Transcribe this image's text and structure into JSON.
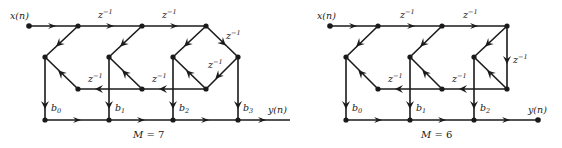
{
  "diagrams": [
    {
      "caption": {
        "var": "M",
        "eq": " = 7"
      },
      "input_label": "x(n)",
      "output_label": "y(n)",
      "delay_label": "z",
      "delay_exp": "−1",
      "coefficients": [
        {
          "base": "b",
          "sub": "0"
        },
        {
          "base": "b",
          "sub": "1"
        },
        {
          "base": "b",
          "sub": "2"
        },
        {
          "base": "b",
          "sub": "3"
        }
      ]
    },
    {
      "caption": {
        "var": "M",
        "eq": " = 6"
      },
      "input_label": "x(n)",
      "output_label": "y(n)",
      "delay_label": "z",
      "delay_exp": "−1",
      "coefficients": [
        {
          "base": "b",
          "sub": "0"
        },
        {
          "base": "b",
          "sub": "1"
        },
        {
          "base": "b",
          "sub": "2"
        }
      ]
    }
  ],
  "colors": {
    "ink": "#1a1a1a",
    "background": "#ffffff"
  }
}
